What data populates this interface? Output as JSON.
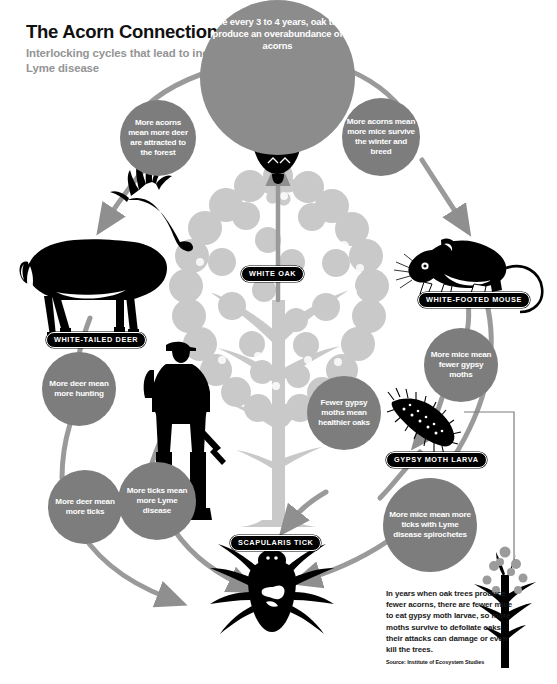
{
  "header": {
    "title": "The Acorn Connection",
    "subtitle": "Interlocking cycles that lead to increased Lyme disease"
  },
  "nodes": {
    "acorn_boom": "Once every 3 to 4 years, oak trees produce an overabundance of acorns",
    "deer_attracted": "More acorns mean more deer are attracted to the forest",
    "mice_survive": "More acorns mean more mice survive the winter and breed",
    "fewer_moths": "More mice mean fewer gypsy moths",
    "healthier_oaks": "Fewer gypsy moths mean healthier oaks",
    "more_ticks_lyme": "More mice mean more ticks with Lyme disease spirochetes",
    "more_hunting": "More deer mean more hunting",
    "deer_ticks": "More deer mean more ticks",
    "ticks_lyme": "More ticks mean more Lyme disease"
  },
  "labels": {
    "white_oak": "WHITE OAK",
    "white_tailed_deer": "WHITE-TAILED DEER",
    "white_footed_mouse": "WHITE-FOOTED MOUSE",
    "gypsy_moth_larva": "GYPSY MOTH LARVA",
    "scapularis_tick": "SCAPULARIS TICK"
  },
  "footnote": {
    "text": "In years when oak trees produce fewer acorns, there are fewer mice to eat gypsy moth larvae, so more moths survive to defoliate oaks; their attacks can damage or even kill the trees.",
    "source": "Source: Institute of Ecosystem Studies"
  },
  "colors": {
    "background": "#ffffff",
    "bubble_large": "#8c8c8c",
    "bubble_small": "#7d7d7d",
    "ring": "#9a9a9a",
    "arrow": "#8f8f8f",
    "tree": "#c9c9c9",
    "silhouette": "#000000",
    "title": "#111111",
    "subtitle": "#949494"
  }
}
